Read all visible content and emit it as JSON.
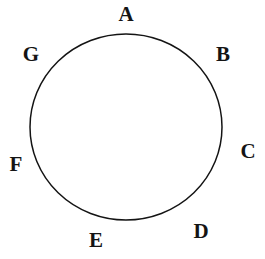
{
  "figure": {
    "background_color": "#ffffff",
    "stroke_color": "#141414",
    "stroke_width": 1.5,
    "width": 265,
    "height": 259
  },
  "circle": {
    "name": "circle-outline",
    "center_x": 126,
    "center_y": 127,
    "radius_x": 96,
    "radius_y": 93,
    "fill": "none"
  },
  "labels": [
    {
      "id": "A",
      "text": "A",
      "x": 126,
      "y": 14,
      "angle_deg": 90
    },
    {
      "id": "B",
      "text": "B",
      "x": 223,
      "y": 54,
      "angle_deg": 45
    },
    {
      "id": "C",
      "text": "C",
      "x": 248,
      "y": 151,
      "angle_deg": 345
    },
    {
      "id": "D",
      "text": "D",
      "x": 201,
      "y": 231,
      "angle_deg": 300
    },
    {
      "id": "E",
      "text": "E",
      "x": 96,
      "y": 240,
      "angle_deg": 255
    },
    {
      "id": "F",
      "text": "F",
      "x": 16,
      "y": 164,
      "angle_deg": 200
    },
    {
      "id": "G",
      "text": "G",
      "x": 31,
      "y": 54,
      "angle_deg": 135
    }
  ]
}
